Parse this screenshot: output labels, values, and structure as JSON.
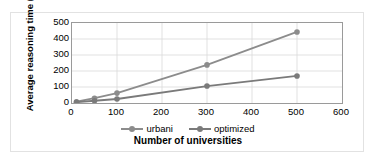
{
  "chart_data": {
    "type": "line",
    "title": "",
    "xlabel": "Number of universities",
    "ylabel": "Average reasoning time (s)",
    "xlim": [
      0,
      600
    ],
    "ylim": [
      0,
      500
    ],
    "xticks": [
      0,
      100,
      200,
      300,
      400,
      500,
      600
    ],
    "yticks": [
      0,
      100,
      200,
      300,
      400,
      500
    ],
    "grid": true,
    "legend_position": "bottom",
    "series": [
      {
        "name": "urbani",
        "color": "#8c8c8c",
        "x": [
          10,
          50,
          100,
          300,
          500
        ],
        "values": [
          8,
          30,
          62,
          238,
          444
        ]
      },
      {
        "name": "optimized",
        "color": "#7a7a7a",
        "x": [
          10,
          50,
          100,
          300,
          500
        ],
        "values": [
          5,
          14,
          25,
          106,
          169
        ]
      }
    ]
  },
  "axes": {
    "y_title": "Average reasoning time (s)",
    "x_title": "Number of universities",
    "y_tick_labels": [
      "500",
      "400",
      "300",
      "200",
      "100",
      "0"
    ],
    "x_tick_labels": [
      "0",
      "100",
      "200",
      "300",
      "400",
      "500",
      "600"
    ]
  },
  "legend": {
    "items": [
      {
        "label": "urbani",
        "color": "#8c8c8c"
      },
      {
        "label": "optimized",
        "color": "#7a7a7a"
      }
    ]
  }
}
